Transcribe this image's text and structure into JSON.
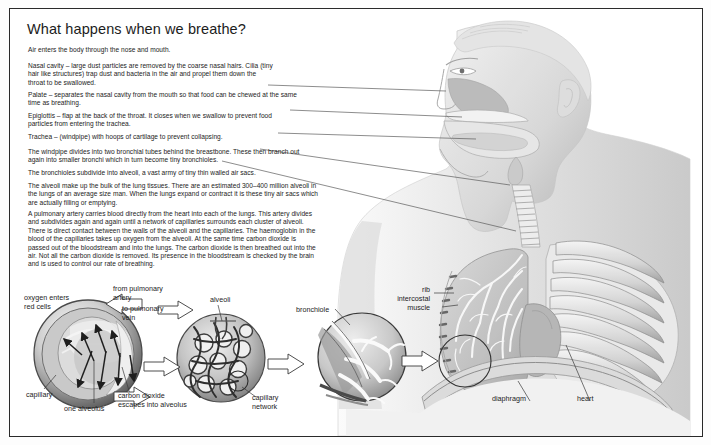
{
  "page": {
    "title": "What happens when we breathe?",
    "background_color": "#ffffff",
    "border_color": "#2a2a2a"
  },
  "body_text": {
    "intro": "Air enters the body through the nose and mouth.",
    "paragraphs": [
      {
        "id": "nasal-cavity",
        "term": "Nasal cavity",
        "text": "Nasal cavity – large dust particles are removed by the coarse nasal hairs. Cilia (tiny hair like structures) trap dust and bacteria in the air and propel them down the throat to be swallowed."
      },
      {
        "id": "palate",
        "term": "Palate",
        "text": "Palate – separates the nasal cavity from the mouth so that food can be chewed at the same time as breathing."
      },
      {
        "id": "epiglottis",
        "term": "Epiglottis",
        "text": "Epiglottis – flap at the back of the throat. It closes when we swallow to prevent food particles from entering the trachea."
      },
      {
        "id": "trachea",
        "term": "Trachea",
        "text": "Trachea – (windpipe) with hoops of cartilage to prevent collapsing."
      },
      {
        "id": "windpipe",
        "term": "",
        "text": "The windpipe divides into two bronchial tubes behind the breastbone. These then branch out again into smaller bronchi which in turn become tiny bronchioles."
      },
      {
        "id": "bronchioles",
        "term": "",
        "text": "The bronchioles subdivide into alveoli, a vast army of tiny thin walled air sacs."
      },
      {
        "id": "alveoli",
        "term": "",
        "text": "The alveoli make up the bulk of the lung tissues. There are an estimated 300–400 million alveoli in the lungs of an average size man. When the lungs expand or contract it is these tiny air sacs which are actually filling or emptying."
      },
      {
        "id": "pulmonary-artery",
        "term": "",
        "text": "A pulmonary artery carries blood directly from the heart into each of the lungs. This artery divides and subdivides again and again until a network of capillaries surrounds each cluster of alveoli. There is direct contact between the walls of the alveoli and the capillaries. The haemoglobin in the blood of the capillaries takes up oxygen from the alveoli. At the same time carbon dioxide is passed out of the bloodstream and into the lungs. The carbon dioxide is then breathed out into the air. Not all the carbon dioxide is removed. Its presence in the bloodstream is checked by the brain and is used to control our rate of breathing."
      }
    ]
  },
  "labels": {
    "oxygen_enters": "oxygen enters\nred cells",
    "from_pulmonary_artery": "from pulmonary\nartery",
    "to_pulmonary_vein": "to pulmonary\nvein",
    "alveoli": "alveoli",
    "bronchiole": "bronchiole",
    "rib": "rib",
    "intercostal_muscle": "intercostal\nmuscle",
    "capillary": "capillary",
    "one_alveolus": "one alveolus",
    "carbon_dioxide_escapes": "carbon dioxide\nescapes into alveolus",
    "capillary_network": "capillary\nnetwork",
    "diaphragm": "diaphragm",
    "heart": "heart"
  },
  "colors": {
    "text": "#232323",
    "leader_line": "#555555",
    "art_light": "#e9e9e9",
    "art_mid": "#b8b8b8",
    "art_dark": "#6d6d6d",
    "art_darkest": "#3a3a3a"
  }
}
